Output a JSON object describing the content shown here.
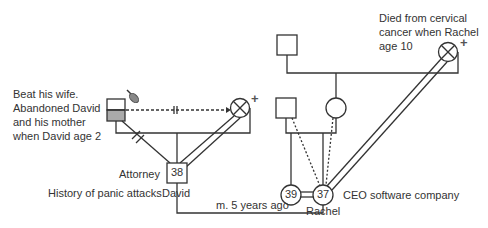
{
  "diagram": {
    "type": "genogram",
    "colors": {
      "line": "#333333",
      "shade": "#aaaaaa",
      "background": "#ffffff"
    },
    "notes": {
      "father_note": [
        "Beat his wife.",
        "Abandoned David",
        "and his mother",
        "when David age 2"
      ],
      "maternal_grandmother_note": [
        "Died from cervical",
        "cancer when Rachel",
        "age 10"
      ]
    },
    "people": {
      "david": {
        "name": "David",
        "age": "38",
        "occupation": "Attorney",
        "note": "History of panic attacks"
      },
      "rachel": {
        "name": "Rachel",
        "age": "37",
        "occupation": "CEO software company"
      },
      "rachel_sibling": {
        "age": "39"
      }
    },
    "relationships": {
      "marriage_label": "m. 5 years ago"
    },
    "symbols": {
      "deceased_mark": "+",
      "cutoff_mark": "||"
    }
  }
}
